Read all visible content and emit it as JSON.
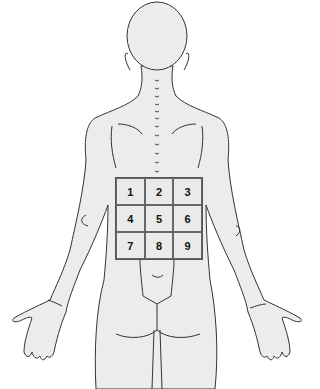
{
  "diagram": {
    "view": "posterior",
    "fill_color": "#ececec",
    "stroke_color": "#333333",
    "grid": {
      "rows": 3,
      "cols": 3,
      "cells": [
        {
          "label": "1"
        },
        {
          "label": "2"
        },
        {
          "label": "3"
        },
        {
          "label": "4"
        },
        {
          "label": "5"
        },
        {
          "label": "6"
        },
        {
          "label": "7"
        },
        {
          "label": "8"
        },
        {
          "label": "9"
        }
      ]
    }
  }
}
